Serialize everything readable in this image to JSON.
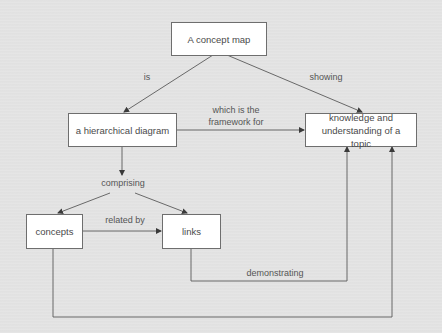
{
  "diagram": {
    "type": "concept-map",
    "colors": {
      "background": "#e3e3e3",
      "node_fill": "#ffffff",
      "node_border": "#6e6e6e",
      "edge": "#5a5a5a",
      "text": "#4a4a4a"
    },
    "nodes": [
      {
        "id": "concept-map",
        "label": "A concept map"
      },
      {
        "id": "hierarchical-diagram",
        "label": "a hierarchical diagram"
      },
      {
        "id": "knowledge",
        "label": "knowledge and understanding of a topic"
      },
      {
        "id": "concepts",
        "label": "concepts"
      },
      {
        "id": "links",
        "label": "links"
      }
    ],
    "edges": [
      {
        "from": "concept-map",
        "to": "hierarchical-diagram",
        "label": "is"
      },
      {
        "from": "concept-map",
        "to": "knowledge",
        "label": "showing"
      },
      {
        "from": "hierarchical-diagram",
        "to": "knowledge",
        "label": "which is the\nframework for"
      },
      {
        "from": "hierarchical-diagram",
        "to": "concepts",
        "label": "comprising"
      },
      {
        "from": "hierarchical-diagram",
        "to": "links",
        "label": "comprising"
      },
      {
        "from": "concepts",
        "to": "links",
        "label": "related by"
      },
      {
        "from": "links",
        "to": "knowledge",
        "label": "demonstrating"
      },
      {
        "from": "concepts",
        "to": "knowledge",
        "label": ""
      }
    ],
    "edge_labels": {
      "is": "is",
      "showing": "showing",
      "framework": "which is the\nframework for",
      "comprising": "comprising",
      "related_by": "related by",
      "demonstrating": "demonstrating"
    }
  }
}
